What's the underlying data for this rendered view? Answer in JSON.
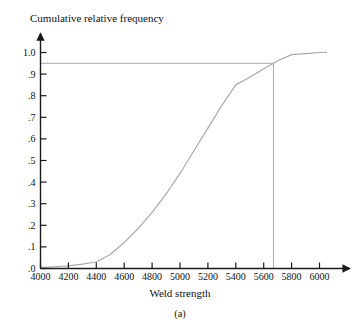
{
  "figure": {
    "title": "Cumulative relative frequency",
    "caption": "(a)",
    "xlabel": "Weld strength"
  },
  "chart_data": {
    "type": "line",
    "title": "Cumulative relative frequency",
    "subtitle": "",
    "caption": "(a)",
    "xlabel": "Weld strength",
    "ylabel": "Cumulative relative frequency",
    "xlim": [
      4000,
      6100
    ],
    "ylim": [
      0.0,
      1.05
    ],
    "xticks": [
      4000,
      4200,
      4400,
      4600,
      4800,
      5000,
      5200,
      5400,
      5600,
      5800,
      6000
    ],
    "xtick_labels": [
      "4000",
      "4200",
      "4400",
      "4600",
      "4800",
      "5000",
      "5200",
      "5400",
      "5600",
      "5800",
      "6000"
    ],
    "yticks": [
      0.0,
      0.1,
      0.2,
      0.3,
      0.4,
      0.5,
      0.6,
      0.7,
      0.8,
      0.9,
      1.0
    ],
    "ytick_labels": [
      ".0",
      ".1",
      ".2",
      ".3",
      ".4",
      ".5",
      ".6",
      ".7",
      ".8",
      ".9",
      "1.0"
    ],
    "grid": false,
    "legend": false,
    "legend_position": "none",
    "axis_arrows": true,
    "series": [
      {
        "name": "Cumulative relative frequency curve",
        "color": "#a9a9a9",
        "x": [
          4000,
          4100,
          4200,
          4300,
          4400,
          4500,
          4600,
          4700,
          4800,
          4900,
          5000,
          5100,
          5200,
          5300,
          5400,
          5500,
          5600,
          5670,
          5700,
          5800,
          5900,
          6000,
          6050
        ],
        "values": [
          0.004,
          0.008,
          0.012,
          0.02,
          0.03,
          0.065,
          0.12,
          0.185,
          0.26,
          0.345,
          0.44,
          0.545,
          0.65,
          0.755,
          0.85,
          0.885,
          0.925,
          0.95,
          0.962,
          0.99,
          0.995,
          1.0,
          1.0
        ]
      }
    ],
    "reference_lines": [
      {
        "name": "percentile-horizontal-line",
        "orientation": "horizontal",
        "value": 0.95,
        "color": "#a9a9a9",
        "from": 4000,
        "to": 5670
      },
      {
        "name": "percentile-vertical-line",
        "orientation": "vertical",
        "value": 5670,
        "color": "#a9a9a9",
        "from": 0.0,
        "to": 0.95
      }
    ],
    "annotations": []
  },
  "colors": {
    "curve": "#a9a9a9",
    "reference": "#a9a9a9",
    "axis": "#1a1a1a",
    "background": "#ffffff",
    "text": "#111111"
  }
}
